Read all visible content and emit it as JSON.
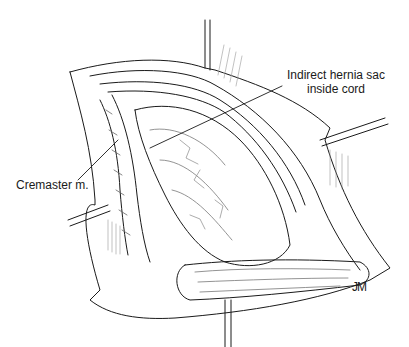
{
  "figure": {
    "type": "surgical-illustration",
    "labels": {
      "hernia_sac": "Indirect hernia sac\ninside cord",
      "hernia_sac_line1": "Indirect hernia sac",
      "hernia_sac_line2": "inside cord",
      "cremaster": "Cremaster m."
    },
    "signature": "JM",
    "colors": {
      "ink": "#1a1a1a",
      "background": "#ffffff",
      "shading": "#555555"
    }
  }
}
